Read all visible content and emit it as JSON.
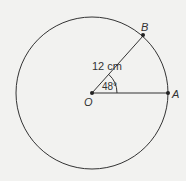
{
  "diagram": {
    "type": "circle-sector",
    "center": {
      "label": "O",
      "x": 92,
      "y": 93
    },
    "radius_px": 76,
    "points": [
      {
        "label": "A",
        "x": 168,
        "y": 93
      },
      {
        "label": "B",
        "x": 143,
        "y": 36
      }
    ],
    "radius_label": "12 cm",
    "angle_label": "48°",
    "angle_degrees": 48,
    "colors": {
      "stroke": "#333333",
      "background": "#f2f2f0"
    }
  }
}
